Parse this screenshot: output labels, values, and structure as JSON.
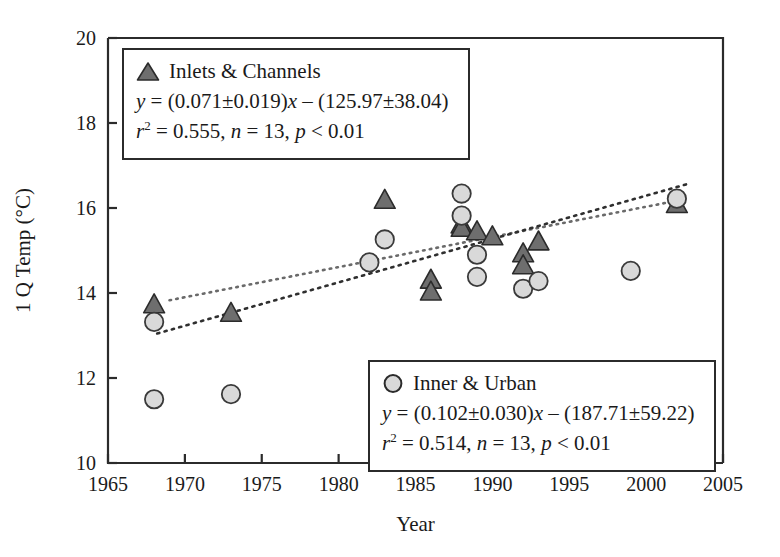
{
  "chart_data": {
    "type": "scatter",
    "title": "",
    "xlabel": "Year",
    "ylabel": "1 Q Temp (°C)",
    "xlim": [
      1965,
      2005
    ],
    "ylim": [
      10,
      20
    ],
    "xticks": [
      1965,
      1970,
      1975,
      1980,
      1985,
      1990,
      1995,
      2000,
      2005
    ],
    "yticks": [
      10,
      12,
      14,
      16,
      18,
      20
    ],
    "grid": false,
    "legend_position": "inside-top-left and inside-bottom-right",
    "series": [
      {
        "name": "Inlets & Channels",
        "marker": "triangle",
        "marker_color": "#6e6e6e",
        "marker_edge_color": "#2b2b2b",
        "n": 13,
        "points": [
          {
            "x": 1968,
            "y": 13.72
          },
          {
            "x": 1973,
            "y": 13.52
          },
          {
            "x": 1983,
            "y": 16.18
          },
          {
            "x": 1986,
            "y": 14.3
          },
          {
            "x": 1986,
            "y": 14.02
          },
          {
            "x": 1988,
            "y": 15.6
          },
          {
            "x": 1988,
            "y": 15.52
          },
          {
            "x": 1989,
            "y": 15.44
          },
          {
            "x": 1990,
            "y": 15.32
          },
          {
            "x": 1992,
            "y": 14.92
          },
          {
            "x": 1992,
            "y": 14.64
          },
          {
            "x": 1993,
            "y": 15.2
          },
          {
            "x": 2002,
            "y": 16.08
          }
        ]
      },
      {
        "name": "Inner & Urban",
        "marker": "circle",
        "marker_color": "#d9d9d9",
        "marker_edge_color": "#3a3a3a",
        "n": 13,
        "points": [
          {
            "x": 1968,
            "y": 13.32
          },
          {
            "x": 1968,
            "y": 11.5
          },
          {
            "x": 1973,
            "y": 11.62
          },
          {
            "x": 1982,
            "y": 14.72
          },
          {
            "x": 1983,
            "y": 15.26
          },
          {
            "x": 1988,
            "y": 16.34
          },
          {
            "x": 1988,
            "y": 15.82
          },
          {
            "x": 1989,
            "y": 14.9
          },
          {
            "x": 1989,
            "y": 14.38
          },
          {
            "x": 1992,
            "y": 14.1
          },
          {
            "x": 1993,
            "y": 14.28
          },
          {
            "x": 1999,
            "y": 14.52
          },
          {
            "x": 2002,
            "y": 16.22
          }
        ]
      }
    ],
    "trendlines": [
      {
        "name": "Inlets & Channels fit",
        "slope": 0.071,
        "intercept": -125.97,
        "x_start": 1969.0,
        "x_end": 2002.6,
        "style": "dotted",
        "color": "#6a6a6a"
      },
      {
        "name": "Inner & Urban fit",
        "slope": 0.102,
        "intercept": -187.71,
        "x_start": 1968.2,
        "x_end": 2002.6,
        "style": "dotted",
        "color": "#2f2f2f"
      }
    ]
  },
  "legends": {
    "inlets": {
      "marker_name": "triangle-marker",
      "label": "Inlets & Channels",
      "equation_prefix": "y",
      "equation_body": " = (0.071±0.019)",
      "equation_x": "x",
      "equation_tail": " – (125.97±38.04)",
      "stats_r": "r",
      "stats_sup": "2",
      "stats_rest": " = 0.555, ",
      "stats_n": "n",
      "stats_n_val": " = 13, ",
      "stats_p": "p",
      "stats_p_val": " < 0.01"
    },
    "inner": {
      "marker_name": "circle-marker",
      "label": "Inner & Urban",
      "equation_prefix": "y",
      "equation_body": " = (0.102±0.030)",
      "equation_x": "x",
      "equation_tail": " – (187.71±59.22)",
      "stats_r": "r",
      "stats_sup": "2",
      "stats_rest": " = 0.514, ",
      "stats_n": "n",
      "stats_n_val": " = 13, ",
      "stats_p": "p",
      "stats_p_val": " < 0.01"
    }
  },
  "axes": {
    "x_title": "Year",
    "y_title": "1 Q Temp (°C)"
  },
  "colors": {
    "axis": "#2b2b2b",
    "triangle_fill": "#6e6e6e",
    "circle_fill": "#d9d9d9",
    "text": "#1a1a1a"
  }
}
